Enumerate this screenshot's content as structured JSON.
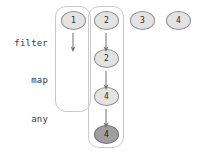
{
  "diagram": {
    "background": "#ffffff",
    "node_fill": "#e3e3e3",
    "node_highlight_fill": "#9f9f9f",
    "node_stroke": "#8e8e8e",
    "group_stroke": "#c9c9c9",
    "arrow_color": "#6f6f6f",
    "stage_labels": [
      {
        "text": "filter",
        "x": 0,
        "y": 38
      },
      {
        "text": "map",
        "x": 0,
        "y": 75
      },
      {
        "text": "any",
        "x": 0,
        "y": 114
      }
    ],
    "groups": [
      {
        "name": "column-group-1",
        "x": 55,
        "y": 6,
        "width": 36,
        "height": 106
      },
      {
        "name": "column-group-2",
        "x": 88,
        "y": 6,
        "width": 36,
        "height": 142
      }
    ],
    "nodes": [
      {
        "id": "n1",
        "label": "1",
        "x": 61,
        "y": 11,
        "highlight": false
      },
      {
        "id": "n2a",
        "label": "2",
        "x": 94,
        "y": 11,
        "highlight": false
      },
      {
        "id": "n3",
        "label": "3",
        "x": 130,
        "y": 11,
        "highlight": false
      },
      {
        "id": "n4s",
        "label": "4",
        "x": 166,
        "y": 11,
        "highlight": false
      },
      {
        "id": "n2b",
        "label": "2",
        "x": 94,
        "y": 49,
        "highlight": false
      },
      {
        "id": "n4a",
        "label": "4",
        "x": 94,
        "y": 87,
        "highlight": false
      },
      {
        "id": "n4b",
        "label": "4",
        "x": 94,
        "y": 125,
        "highlight": true
      }
    ],
    "arrows": [
      {
        "name": "arrow-col1-filter",
        "x": 68,
        "y": 33
      },
      {
        "name": "arrow-col2-filter",
        "x": 101,
        "y": 33
      },
      {
        "name": "arrow-col2-map",
        "x": 101,
        "y": 71
      },
      {
        "name": "arrow-col2-any",
        "x": 101,
        "y": 109
      }
    ]
  }
}
